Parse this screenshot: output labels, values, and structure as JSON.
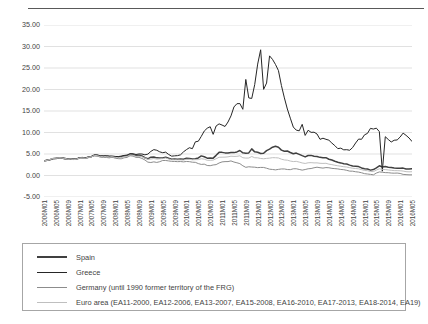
{
  "chart_data": {
    "type": "line",
    "title": "",
    "subtitle": "",
    "xlabel": "",
    "ylabel": "",
    "ylim": [
      -5,
      35
    ],
    "ytick_labels": [
      "35.00",
      "30.00",
      "25.00",
      "20.00",
      "15.00",
      "10.00",
      "5.00",
      "0.00",
      "-5.00"
    ],
    "ytick_values": [
      35,
      30,
      25,
      20,
      15,
      10,
      5,
      0,
      -5
    ],
    "grid": true,
    "legend_position": "below-plot",
    "x_start": "2006M01",
    "x_end": "2016M05",
    "x_tick_step_months": 4,
    "xtick_labels": [
      "2006M01",
      "2006M05",
      "2006M09",
      "2007M01",
      "2007M05",
      "2007M09",
      "2008M01",
      "2008M05",
      "2008M09",
      "2009M01",
      "2009M05",
      "2009M09",
      "2010M01",
      "2010M05",
      "2010M09",
      "2011M01",
      "2011M05",
      "2011M09",
      "2012M01",
      "2012M05",
      "2012M09",
      "2013M01",
      "2013M05",
      "2013M09",
      "2014M01",
      "2014M05",
      "2014M09",
      "2015M01",
      "2015M05",
      "2015M09",
      "2016M01",
      "2016M05"
    ],
    "series": [
      {
        "name": "Spain",
        "color": "#404040",
        "width": 1.5,
        "values": [
          3.39,
          3.54,
          3.68,
          3.89,
          3.95,
          4.05,
          4.05,
          3.92,
          3.78,
          3.84,
          3.76,
          3.83,
          4.1,
          4.13,
          4.06,
          4.25,
          4.38,
          4.7,
          4.67,
          4.47,
          4.45,
          4.46,
          4.38,
          4.35,
          4.26,
          4.22,
          4.34,
          4.52,
          4.59,
          4.87,
          4.85,
          4.64,
          4.72,
          4.56,
          4.13,
          3.88,
          4.27,
          4.31,
          4.1,
          4.09,
          4.08,
          4.27,
          4.0,
          3.8,
          3.81,
          3.8,
          3.83,
          3.8,
          3.99,
          3.98,
          3.83,
          3.9,
          4.08,
          4.56,
          4.36,
          4.04,
          4.09,
          4.04,
          4.69,
          5.38,
          5.38,
          5.26,
          5.25,
          5.33,
          5.32,
          5.48,
          5.81,
          5.27,
          5.2,
          5.26,
          6.19,
          5.5,
          5.4,
          5.11,
          5.17,
          5.79,
          6.13,
          6.59,
          6.79,
          6.58,
          5.91,
          5.65,
          5.69,
          5.35,
          5.05,
          5.21,
          4.92,
          4.61,
          4.32,
          4.64,
          4.68,
          4.5,
          4.42,
          4.22,
          4.13,
          4.14,
          3.78,
          3.59,
          3.31,
          3.1,
          2.93,
          2.72,
          2.67,
          2.42,
          2.2,
          2.14,
          2.07,
          1.76,
          1.55,
          1.51,
          1.25,
          1.37,
          1.79,
          2.25,
          1.98,
          2.07,
          1.94,
          1.84,
          1.72,
          1.7,
          1.71,
          1.72,
          1.5,
          1.51,
          1.6
        ]
      },
      {
        "name": "Greece",
        "color": "#262626",
        "width": 1.0,
        "values": [
          3.43,
          3.58,
          3.7,
          3.96,
          4.07,
          4.18,
          4.17,
          4.04,
          3.89,
          3.93,
          3.84,
          3.89,
          4.17,
          4.21,
          4.13,
          4.33,
          4.46,
          4.79,
          4.79,
          4.57,
          4.57,
          4.59,
          4.54,
          4.53,
          4.43,
          4.4,
          4.51,
          4.66,
          4.76,
          5.09,
          5.07,
          4.88,
          5.01,
          5.0,
          4.81,
          4.97,
          5.6,
          6.02,
          5.87,
          5.5,
          5.3,
          5.43,
          4.89,
          4.5,
          4.57,
          4.62,
          4.81,
          5.49,
          6.02,
          6.46,
          6.24,
          7.83,
          7.97,
          9.1,
          10.34,
          11.0,
          11.34,
          9.57,
          11.52,
          12.01,
          11.73,
          11.4,
          12.44,
          13.86,
          15.94,
          16.69,
          16.73,
          15.39,
          22.34,
          18.04,
          17.92,
          21.14,
          25.91,
          29.24,
          20.04,
          21.5,
          27.82,
          27.0,
          25.83,
          24.4,
          20.93,
          18.05,
          15.46,
          13.33,
          11.27,
          10.55,
          10.39,
          11.9,
          9.32,
          10.52,
          10.03,
          10.07,
          9.65,
          8.41,
          8.67,
          8.42,
          8.21,
          7.54,
          6.95,
          6.25,
          6.36,
          5.97,
          6.0,
          5.87,
          6.51,
          7.56,
          8.47,
          8.42,
          9.46,
          9.79,
          10.96,
          10.8,
          11.01,
          10.2,
          1.0,
          9.02,
          8.38,
          7.79,
          8.2,
          8.27,
          8.95,
          9.86,
          9.34,
          8.73,
          7.92
        ]
      },
      {
        "name": "Germany (until 1990 former territory of the FRG)",
        "color": "#8c8c8c",
        "width": 1.0,
        "values": [
          3.31,
          3.48,
          3.65,
          3.92,
          3.96,
          4.05,
          4.04,
          3.86,
          3.75,
          3.8,
          3.71,
          3.76,
          4.02,
          4.04,
          3.95,
          4.17,
          4.31,
          4.62,
          4.51,
          4.25,
          4.21,
          4.2,
          4.1,
          4.26,
          4.02,
          3.92,
          3.88,
          4.12,
          4.21,
          4.59,
          4.51,
          4.22,
          4.21,
          3.97,
          3.61,
          3.1,
          3.02,
          3.17,
          3.04,
          3.21,
          3.49,
          3.49,
          3.39,
          3.29,
          3.27,
          3.22,
          3.25,
          3.17,
          3.26,
          3.22,
          3.09,
          3.06,
          2.77,
          2.58,
          2.64,
          2.33,
          2.28,
          2.45,
          2.53,
          2.91,
          3.16,
          3.23,
          3.24,
          3.39,
          3.13,
          2.96,
          2.76,
          2.26,
          1.9,
          2.03,
          1.97,
          1.93,
          1.83,
          1.88,
          1.87,
          1.69,
          1.47,
          1.4,
          1.31,
          1.42,
          1.52,
          1.52,
          1.39,
          1.36,
          1.56,
          1.57,
          1.41,
          1.25,
          1.39,
          1.56,
          1.62,
          1.8,
          1.93,
          1.81,
          1.72,
          1.84,
          1.8,
          1.66,
          1.6,
          1.53,
          1.41,
          1.35,
          1.2,
          1.02,
          1.0,
          0.87,
          0.79,
          0.64,
          0.43,
          0.35,
          0.26,
          0.16,
          0.57,
          0.83,
          0.76,
          0.67,
          0.65,
          0.57,
          0.54,
          0.57,
          0.48,
          0.26,
          0.21,
          0.16,
          0.16
        ]
      },
      {
        "name": "Euro area (EA11-2000, EA12-2006, EA13-2007, EA15-2008, EA16-2010, EA17-2013, EA18-2014, EA19)",
        "color": "#bfbfbf",
        "width": 1.0,
        "values": [
          3.36,
          3.54,
          3.73,
          4.01,
          4.06,
          4.13,
          4.1,
          3.97,
          3.8,
          3.86,
          3.76,
          3.82,
          4.07,
          4.1,
          4.03,
          4.25,
          4.37,
          4.66,
          4.62,
          4.4,
          4.38,
          4.4,
          4.31,
          4.38,
          4.2,
          4.16,
          4.19,
          4.36,
          4.44,
          4.78,
          4.71,
          4.45,
          4.49,
          4.37,
          4.07,
          3.75,
          3.83,
          3.95,
          3.81,
          3.87,
          3.93,
          4.07,
          3.84,
          3.66,
          3.66,
          3.63,
          3.63,
          3.59,
          3.76,
          3.77,
          3.65,
          3.69,
          3.69,
          3.9,
          3.8,
          3.53,
          3.53,
          3.58,
          3.9,
          4.24,
          4.26,
          4.27,
          4.34,
          4.49,
          4.44,
          4.46,
          4.58,
          4.13,
          4.05,
          4.06,
          4.42,
          4.13,
          4.11,
          3.96,
          3.89,
          3.98,
          4.04,
          4.15,
          4.13,
          4.08,
          3.79,
          3.62,
          3.56,
          3.36,
          3.24,
          3.29,
          3.12,
          2.92,
          2.8,
          2.96,
          2.99,
          2.93,
          2.94,
          2.84,
          2.81,
          2.84,
          2.64,
          2.53,
          2.38,
          2.26,
          2.16,
          2.04,
          1.97,
          1.82,
          1.69,
          1.62,
          1.55,
          1.36,
          1.17,
          1.12,
          0.93,
          0.91,
          1.25,
          1.56,
          1.39,
          1.38,
          1.29,
          1.21,
          1.13,
          1.13,
          1.1,
          1.03,
          0.89,
          0.85,
          0.88
        ]
      }
    ]
  },
  "legend": {
    "items": [
      {
        "label": "Spain",
        "color": "#404040"
      },
      {
        "label": "Greece",
        "color": "#262626"
      },
      {
        "label": "Germany (until 1990 former territory of the FRG)",
        "color": "#8c8c8c"
      },
      {
        "label": "Euro area (EA11-2000, EA12-2006, EA13-2007, EA15-2008, EA16-2010, EA17-2013, EA18-2014, EA19)",
        "color": "#bfbfbf"
      }
    ]
  },
  "colors": {
    "grid": "#d9d9d9",
    "text": "#3f3f3f",
    "top_rule": "#595959",
    "legend_border": "#a6a6a6"
  }
}
